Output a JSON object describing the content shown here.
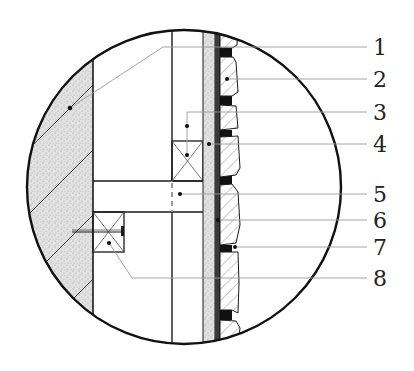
{
  "diagram": {
    "type": "architectural-section-detail",
    "colors": {
      "line": "#1a1a1a",
      "leader": "#9a9a9a",
      "stipple_bg": "#e4e4e4",
      "joint": "#111111",
      "background": "#ffffff"
    },
    "callouts": [
      {
        "id": "1",
        "label": "1",
        "y": 47
      },
      {
        "id": "2",
        "label": "2",
        "y": 79
      },
      {
        "id": "3",
        "label": "3",
        "y": 112
      },
      {
        "id": "4",
        "label": "4",
        "y": 144
      },
      {
        "id": "5",
        "label": "5",
        "y": 194
      },
      {
        "id": "6",
        "label": "6",
        "y": 220
      },
      {
        "id": "7",
        "label": "7",
        "y": 247
      },
      {
        "id": "8",
        "label": "8",
        "y": 278
      }
    ],
    "components": [
      "concrete-wall",
      "timber-stud",
      "timber-blocking-upper",
      "timber-blocking-lower",
      "horizontal-member",
      "sheathing-board",
      "membrane",
      "stone-veneer",
      "mortar-joints",
      "anchor-bolt"
    ]
  }
}
